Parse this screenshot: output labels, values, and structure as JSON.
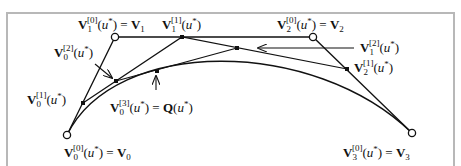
{
  "figure": {
    "colors": {
      "line": "#111111",
      "frame": "#b8b8b8",
      "background": "#ffffff"
    }
  },
  "points": {
    "V0": {
      "x": 67,
      "y": 135
    },
    "V1": {
      "x": 115,
      "y": 37
    },
    "V2": {
      "x": 313,
      "y": 37
    },
    "V3": {
      "x": 412,
      "y": 133
    },
    "V0_1": {
      "x": 83,
      "y": 103
    },
    "V1_1": {
      "x": 182,
      "y": 37
    },
    "V2_1": {
      "x": 347,
      "y": 69
    },
    "V0_2": {
      "x": 116,
      "y": 81
    },
    "V1_2": {
      "x": 237,
      "y": 48
    },
    "Q": {
      "x": 157,
      "y": 71
    }
  },
  "labels": {
    "V1_0": {
      "base": "V",
      "sub": "1",
      "sup": "[0]",
      "rest": "(u*) = V",
      "rest_sub": "1"
    },
    "V1_1": {
      "base": "V",
      "sub": "1",
      "sup": "[1]",
      "rest": "(u*)"
    },
    "V2_0": {
      "base": "V",
      "sub": "2",
      "sup": "[0]",
      "rest": "(u*) = V",
      "rest_sub": "2"
    },
    "V0_2": {
      "base": "V",
      "sub": "0",
      "sup": "[2]",
      "rest": "(u*)"
    },
    "V1_2": {
      "base": "V",
      "sub": "1",
      "sup": "[2]",
      "rest": "(u*)"
    },
    "V2_1": {
      "base": "V",
      "sub": "2",
      "sup": "[1]",
      "rest": "(u*)"
    },
    "V0_1": {
      "base": "V",
      "sub": "0",
      "sup": "[1]",
      "rest": "(u*)"
    },
    "V0_3": {
      "base": "V",
      "sub": "0",
      "sup": "[3]",
      "rest": "(u*) = Q(u*)"
    },
    "V0_0": {
      "base": "V",
      "sub": "0",
      "sup": "[0]",
      "rest": "(u*) = V",
      "rest_sub": "0"
    },
    "V3_0": {
      "base": "V",
      "sub": "3",
      "sup": "[0]",
      "rest": "(u*) = V",
      "rest_sub": "3"
    }
  }
}
